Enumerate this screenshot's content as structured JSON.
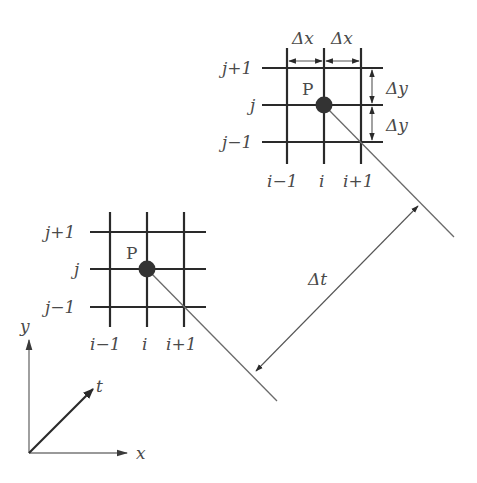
{
  "diagram": {
    "type": "finite-difference-grid-time-marching",
    "colors": {
      "grid": "#2a2a2a",
      "node": "#333333",
      "diagonal": "#6a6a6a",
      "label": "#4a4a4a",
      "background": "#ffffff"
    },
    "upper_grid": {
      "point_label": "P",
      "row_labels": [
        "j+1",
        "j",
        "j−1"
      ],
      "col_labels": [
        "i−1",
        "i",
        "i+1"
      ],
      "dx_labels": [
        "Δx",
        "Δx"
      ],
      "dy_labels": [
        "Δy",
        "Δy"
      ]
    },
    "lower_grid": {
      "point_label": "P",
      "row_labels": [
        "j+1",
        "j",
        "j−1"
      ],
      "col_labels": [
        "i−1",
        "i",
        "i+1"
      ]
    },
    "time_step": {
      "label": "Δt"
    },
    "axes": {
      "x_label": "x",
      "y_label": "y",
      "t_label": "t"
    }
  }
}
